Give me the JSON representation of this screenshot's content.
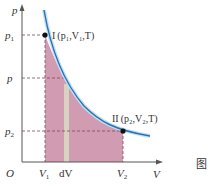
{
  "diagram": {
    "type": "p-V isothermal diagram",
    "axes": {
      "y_label": "p",
      "x_label": "V",
      "origin_label": "O"
    },
    "y_ticks": [
      {
        "label": "p",
        "sub": "1"
      },
      {
        "label": "p",
        "sub": ""
      },
      {
        "label": "p",
        "sub": "2"
      }
    ],
    "x_ticks": [
      {
        "label": "V",
        "sub": "1"
      },
      {
        "label": "dV",
        "sub": ""
      },
      {
        "label": "V",
        "sub": "2"
      }
    ],
    "points": [
      {
        "roman": "I",
        "label": "(p₁,V₁,T)"
      },
      {
        "roman": "II",
        "label": "(p₂,V₂,T)"
      }
    ],
    "caption_char": "图",
    "colors": {
      "curve": "#2f6fb0",
      "curve_glow": "#bfe3f5",
      "area_fill": "#c98aa5",
      "strip_fill": "#d8d2c0",
      "axis": "#555555",
      "dash": "#7a4a5e"
    }
  }
}
